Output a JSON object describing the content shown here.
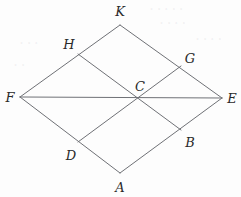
{
  "figure": {
    "kind": "geometry-diagram",
    "shape_name": "rhombus with midpoint segments",
    "width": 241,
    "height": 197,
    "background_color": "#fdfdfd",
    "stroke_color": "#6f7176",
    "stroke_width": 1,
    "label_color": "#2a2a2a"
  },
  "points": [
    {
      "id": "K",
      "label": "K",
      "x": 120,
      "y": 25,
      "label_x": 120,
      "label_y": 11,
      "role": "top-vertex"
    },
    {
      "id": "E",
      "label": "E",
      "x": 222,
      "y": 98,
      "label_x": 232,
      "label_y": 98,
      "role": "right-vertex"
    },
    {
      "id": "A",
      "label": "A",
      "x": 120,
      "y": 173,
      "label_x": 120,
      "label_y": 187,
      "role": "bottom-vertex"
    },
    {
      "id": "F",
      "label": "F",
      "x": 20,
      "y": 97,
      "label_x": 10,
      "label_y": 97,
      "role": "left-vertex"
    },
    {
      "id": "H",
      "label": "H",
      "x": 78,
      "y": 54,
      "label_x": 69,
      "label_y": 44,
      "role": "midpoint-FK"
    },
    {
      "id": "G",
      "label": "G",
      "x": 181,
      "y": 66,
      "label_x": 190,
      "label_y": 58,
      "role": "midpoint-KE"
    },
    {
      "id": "B",
      "label": "B",
      "x": 181,
      "y": 130,
      "label_x": 190,
      "label_y": 142,
      "role": "midpoint-EA"
    },
    {
      "id": "D",
      "label": "D",
      "x": 78,
      "y": 142,
      "label_x": 71,
      "label_y": 155,
      "role": "midpoint-AF"
    },
    {
      "id": "C",
      "label": "C",
      "x": 141,
      "y": 98,
      "label_x": 140,
      "label_y": 86,
      "role": "center-intersection"
    }
  ],
  "segments": [
    {
      "name": "side-F-K",
      "from": "F",
      "to": "K"
    },
    {
      "name": "side-K-E",
      "from": "K",
      "to": "E"
    },
    {
      "name": "side-E-A",
      "from": "E",
      "to": "A"
    },
    {
      "name": "side-A-F",
      "from": "A",
      "to": "F"
    },
    {
      "name": "diagonal-F-E",
      "from": "F",
      "to": "E"
    },
    {
      "name": "segment-H-B",
      "from": "H",
      "to": "B"
    },
    {
      "name": "segment-D-G",
      "from": "D",
      "to": "G"
    }
  ],
  "background_bleed": [
    {
      "text": "• • • • •",
      "x": 150,
      "y": 4
    },
    {
      "text": "• • • •",
      "x": 160,
      "y": 18
    },
    {
      "text": "• • •",
      "x": 20,
      "y": 38
    },
    {
      "text": "• • • •",
      "x": 196,
      "y": 34
    },
    {
      "text": "• •",
      "x": 14,
      "y": 60
    }
  ]
}
